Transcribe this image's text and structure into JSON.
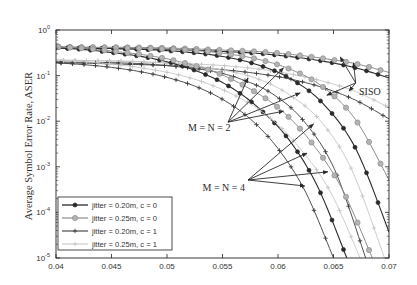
{
  "chart_data": {
    "type": "line",
    "title": "",
    "xlabel": "",
    "ylabel": "Average Symbol Error Rate, ASER",
    "xscale": "linear",
    "yscale": "log",
    "xlim": [
      0.04,
      0.07
    ],
    "ylim": [
      1e-05,
      1
    ],
    "grid": false,
    "legend_position": "lower left",
    "xticks": [
      0.04,
      0.045,
      0.05,
      0.055,
      0.06,
      0.065,
      0.07
    ],
    "xticklabels": [
      "0.04",
      "0.045",
      "0.05",
      "0.055",
      "0.06",
      "0.065",
      "0.07"
    ],
    "yticks_log10": [
      0,
      -1,
      -2,
      -3,
      -4,
      -5
    ],
    "yticklabels": [
      {
        "base": "10",
        "exp": "0"
      },
      {
        "base": "10",
        "exp": "-1"
      },
      {
        "base": "10",
        "exp": "-2"
      },
      {
        "base": "10",
        "exp": "-3"
      },
      {
        "base": "10",
        "exp": "-4"
      },
      {
        "base": "10",
        "exp": "-5"
      }
    ],
    "legend": [
      "jitter = 0.20m, c = 0",
      "jitter = 0.25m, c = 0",
      "jitter = 0.20m, c = 1",
      "jitter = 0.25m, c = 1"
    ],
    "styles": [
      {
        "line": "#2a2a2a",
        "marker": "circle",
        "marker_fill": "#2a2a2a",
        "marker_stroke": "#2a2a2a",
        "r": 2.0,
        "width": 1.1
      },
      {
        "line": "#8e8e8e",
        "marker": "circle",
        "marker_fill": "#b4b4b4",
        "marker_stroke": "#8e8e8e",
        "r": 2.6,
        "width": 1.0
      },
      {
        "line": "#3c3c3c",
        "marker": "plus",
        "marker_fill": "none",
        "marker_stroke": "#3c3c3c",
        "r": 2.2,
        "width": 0.9
      },
      {
        "line": "#c6c6c6",
        "marker": "plus",
        "marker_fill": "none",
        "marker_stroke": "#c6c6c6",
        "r": 2.2,
        "width": 0.9
      }
    ],
    "series": [
      {
        "group": "SISO",
        "name": "jitter = 0.20m, c = 0",
        "style": 0,
        "x": [
          0.04,
          0.043,
          0.046,
          0.049,
          0.052,
          0.055,
          0.058,
          0.061,
          0.064,
          0.067,
          0.07
        ],
        "y_log10": [
          -0.39,
          -0.4,
          -0.41,
          -0.42,
          -0.44,
          -0.47,
          -0.51,
          -0.58,
          -0.68,
          -0.83,
          -1.05
        ]
      },
      {
        "group": "SISO",
        "name": "jitter = 0.25m, c = 0",
        "style": 1,
        "x": [
          0.04,
          0.043,
          0.046,
          0.049,
          0.052,
          0.055,
          0.058,
          0.061,
          0.064,
          0.067,
          0.07
        ],
        "y_log10": [
          -0.37,
          -0.38,
          -0.38,
          -0.39,
          -0.41,
          -0.44,
          -0.47,
          -0.53,
          -0.62,
          -0.74,
          -0.93
        ]
      },
      {
        "group": "SISO",
        "name": "jitter = 0.20m, c = 1",
        "style": 2,
        "x": [
          0.04,
          0.043,
          0.046,
          0.049,
          0.052,
          0.055,
          0.058,
          0.061,
          0.064,
          0.067,
          0.07
        ],
        "y_log10": [
          -0.72,
          -0.73,
          -0.75,
          -0.77,
          -0.81,
          -0.87,
          -0.95,
          -1.07,
          -1.26,
          -1.54,
          -1.95
        ]
      },
      {
        "group": "SISO",
        "name": "jitter = 0.25m, c = 1",
        "style": 3,
        "x": [
          0.04,
          0.043,
          0.046,
          0.049,
          0.052,
          0.055,
          0.058,
          0.061,
          0.064,
          0.067,
          0.07
        ],
        "y_log10": [
          -0.66,
          -0.67,
          -0.68,
          -0.71,
          -0.74,
          -0.78,
          -0.85,
          -0.96,
          -1.12,
          -1.35,
          -1.7
        ]
      },
      {
        "group": "M = N = 2",
        "name": "jitter = 0.20m, c = 0",
        "style": 0,
        "x": [
          0.04,
          0.043,
          0.046,
          0.049,
          0.052,
          0.055,
          0.058,
          0.061,
          0.064,
          0.067,
          0.07
        ],
        "y_log10": [
          -0.39,
          -0.4,
          -0.41,
          -0.44,
          -0.49,
          -0.58,
          -0.75,
          -1.05,
          -1.6,
          -2.6,
          -4.43
        ]
      },
      {
        "group": "M = N = 2",
        "name": "jitter = 0.25m, c = 0",
        "style": 1,
        "x": [
          0.04,
          0.043,
          0.046,
          0.049,
          0.052,
          0.055,
          0.058,
          0.061,
          0.064,
          0.067,
          0.07
        ],
        "y_log10": [
          -0.37,
          -0.38,
          -0.39,
          -0.41,
          -0.44,
          -0.51,
          -0.63,
          -0.85,
          -1.24,
          -1.97,
          -3.29
        ]
      },
      {
        "group": "M = N = 2",
        "name": "jitter = 0.20m, c = 1",
        "style": 2,
        "x": [
          0.04,
          0.0428,
          0.0456,
          0.0484,
          0.0512,
          0.054,
          0.0567,
          0.0595,
          0.0623,
          0.0651,
          0.0679
        ],
        "y_log10": [
          -0.7,
          -0.71,
          -0.72,
          -0.75,
          -0.81,
          -0.9,
          -1.08,
          -1.4,
          -1.99,
          -3.06,
          -5.0
        ]
      },
      {
        "group": "M = N = 2",
        "name": "jitter = 0.25m, c = 1",
        "style": 3,
        "x": [
          0.04,
          0.043,
          0.0459,
          0.0489,
          0.0518,
          0.0548,
          0.0578,
          0.0607,
          0.0637,
          0.0666,
          0.0696
        ],
        "y_log10": [
          -0.66,
          -0.67,
          -0.69,
          -0.71,
          -0.77,
          -0.87,
          -1.04,
          -1.37,
          -1.96,
          -3.04,
          -5.0
        ]
      },
      {
        "group": "M = N = 4",
        "name": "jitter = 0.20m, c = 0",
        "style": 0,
        "x": [
          0.04,
          0.0426,
          0.0452,
          0.0479,
          0.0505,
          0.0531,
          0.0557,
          0.0583,
          0.061,
          0.0636,
          0.0662
        ],
        "y_log10": [
          -0.39,
          -0.43,
          -0.5,
          -0.59,
          -0.73,
          -0.94,
          -1.25,
          -1.72,
          -2.41,
          -3.45,
          -5.0
        ]
      },
      {
        "group": "M = N = 4",
        "name": "jitter = 0.25m, c = 0",
        "style": 1,
        "x": [
          0.04,
          0.0429,
          0.0457,
          0.0486,
          0.0514,
          0.0543,
          0.0571,
          0.06,
          0.0628,
          0.0657,
          0.0685
        ],
        "y_log10": [
          -0.37,
          -0.41,
          -0.48,
          -0.57,
          -0.71,
          -0.92,
          -1.24,
          -1.7,
          -2.4,
          -3.45,
          -5.0
        ]
      },
      {
        "group": "M = N = 4",
        "name": "jitter = 0.20m, c = 1",
        "style": 2,
        "x": [
          0.04,
          0.0425,
          0.045,
          0.0475,
          0.05,
          0.0525,
          0.055,
          0.0575,
          0.06,
          0.0625,
          0.065
        ],
        "y_log10": [
          -0.72,
          -0.76,
          -0.82,
          -0.91,
          -1.04,
          -1.23,
          -1.52,
          -1.95,
          -2.6,
          -3.56,
          -5.0
        ]
      },
      {
        "group": "M = N = 4",
        "name": "jitter = 0.25m, c = 1",
        "style": 3,
        "x": [
          0.04,
          0.0427,
          0.0455,
          0.0482,
          0.051,
          0.0537,
          0.0564,
          0.0592,
          0.0619,
          0.0647,
          0.0674
        ],
        "y_log10": [
          -0.66,
          -0.7,
          -0.76,
          -0.85,
          -0.98,
          -1.18,
          -1.47,
          -1.91,
          -2.57,
          -3.54,
          -5.0
        ]
      }
    ],
    "annotations": [
      {
        "text": "SISO",
        "text_x": 0.0673,
        "text_y_log10": -1.43,
        "origin": [
          0.067,
          -1.16
        ],
        "targets": [
          [
            0.0656,
            -0.59
          ],
          [
            0.0668,
            -0.72
          ],
          [
            0.0644,
            -1.43
          ],
          [
            0.0664,
            -1.34
          ]
        ]
      },
      {
        "text": "M = N = 2",
        "text_x": 0.0519,
        "text_y_log10": -2.21,
        "origin": [
          0.0555,
          -2.02
        ],
        "targets": [
          [
            0.0573,
            -1.05
          ],
          [
            0.0605,
            -0.83
          ],
          [
            0.0605,
            -1.78
          ],
          [
            0.062,
            -1.38
          ]
        ]
      },
      {
        "text": "M = N = 4",
        "text_x": 0.0532,
        "text_y_log10": -3.53,
        "origin": [
          0.0573,
          -3.29
        ],
        "targets": [
          [
            0.0632,
            -2.06
          ],
          [
            0.0626,
            -2.7
          ],
          [
            0.0645,
            -3.11
          ],
          [
            0.0624,
            -3.42
          ]
        ]
      }
    ]
  }
}
